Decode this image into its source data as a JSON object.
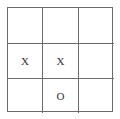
{
  "board": {
    "rows": 3,
    "cols": 3,
    "cells": [
      [
        "",
        "",
        ""
      ],
      [
        "X",
        "X",
        ""
      ],
      [
        "",
        "O",
        ""
      ]
    ]
  }
}
